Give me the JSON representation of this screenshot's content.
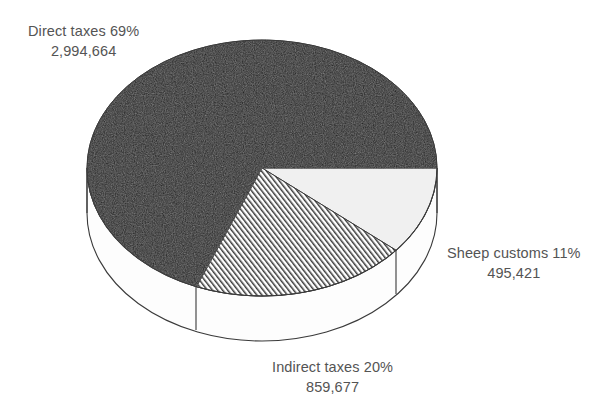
{
  "chart_data": {
    "type": "pie",
    "title": "",
    "subtitle": "",
    "xlabel": "",
    "ylabel": "",
    "legend_position": "none",
    "grid": false,
    "style": "3d-exploded-none",
    "total": 4349762,
    "categories": [
      "Direct taxes",
      "Indirect taxes",
      "Sheep customs"
    ],
    "values": [
      2994664,
      859677,
      495421
    ],
    "percentages": [
      69,
      20,
      11
    ],
    "slices": [
      {
        "name": "Direct taxes",
        "label_line1": "Direct taxes 69%",
        "label_line2": "2,994,664",
        "value": 2994664,
        "value_text": "2,994,664",
        "percent": 69,
        "percent_text": "69%",
        "fill": "#1c1c1c",
        "pattern": "solid-dark",
        "start_angle_deg": 112,
        "end_angle_deg": 360
      },
      {
        "name": "Indirect taxes",
        "label_line1": "Indirect taxes 20%",
        "label_line2": "859,677",
        "value": 859677,
        "value_text": "859,677",
        "percent": 20,
        "percent_text": "20%",
        "fill": "#ffffff",
        "pattern": "diagonal-hatch",
        "start_angle_deg": 40,
        "end_angle_deg": 112
      },
      {
        "name": "Sheep customs",
        "label_line1": "Sheep customs 11%",
        "label_line2": "495,421",
        "value": 495421,
        "value_text": "495,421",
        "percent": 11,
        "percent_text": "11%",
        "fill": "#f0f0f0",
        "pattern": "solid-light",
        "start_angle_deg": 0,
        "end_angle_deg": 40
      }
    ],
    "colors": {
      "background": "#ffffff",
      "text": "#545454",
      "outline": "#3a3a3a",
      "dark_slice": "#1c1c1c",
      "light_slice": "#f0f0f0",
      "side_wall": "#fdfdfd"
    }
  },
  "labels": {
    "direct": {
      "line1": "Direct taxes 69%",
      "line2": "2,994,664"
    },
    "indirect": {
      "line1": "Indirect taxes 20%",
      "line2": "859,677"
    },
    "sheep": {
      "line1": "Sheep customs 11%",
      "line2": "495,421"
    }
  }
}
